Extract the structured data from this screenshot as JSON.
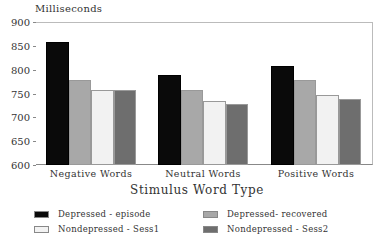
{
  "chart_data": {
    "type": "bar",
    "title": "",
    "ylabel": "Milliseconds",
    "xlabel": "Stimulus Word Type",
    "ylim": [
      600,
      900
    ],
    "yticks": [
      600,
      650,
      700,
      750,
      800,
      850,
      900
    ],
    "categories": [
      "Negative Words",
      "Neutral Words",
      "Positive Words"
    ],
    "series": [
      {
        "name": "Depressed - episode",
        "color": "#0a0a0a",
        "values": [
          860,
          790,
          810
        ]
      },
      {
        "name": "Depressed- recovered",
        "color": "#a8a8a8",
        "values": [
          780,
          760,
          780
        ]
      },
      {
        "name": "Nondepressed - Sess1",
        "color": "#f2f2f2",
        "values": [
          760,
          737,
          750
        ]
      },
      {
        "name": "Nondepressed - Sess2",
        "color": "#6e6e6e",
        "values": [
          760,
          730,
          740
        ]
      }
    ],
    "legend_position": "bottom",
    "grid": false
  }
}
